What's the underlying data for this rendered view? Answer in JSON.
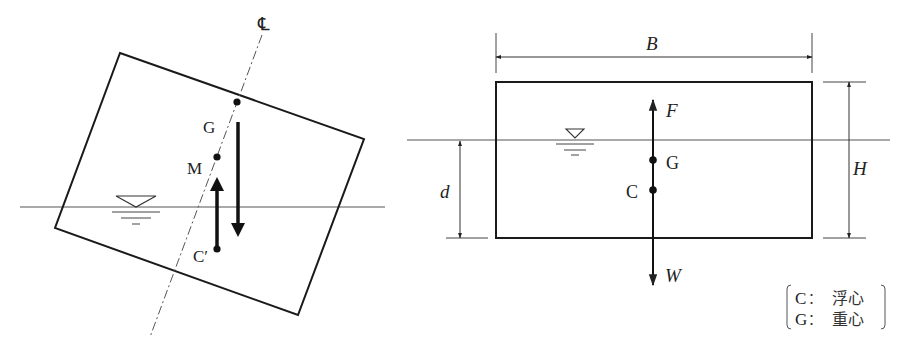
{
  "left_figure": {
    "centerline_label": "℄",
    "labels": {
      "G": "G",
      "M": "M",
      "C_prime": "C′"
    },
    "water_symbol": "▽"
  },
  "right_figure": {
    "dimensions": {
      "width": "B",
      "height": "H",
      "draft": "d"
    },
    "forces": {
      "buoyancy": "F",
      "weight": "W"
    },
    "points": {
      "G": "G",
      "C": "C"
    },
    "water_symbol": "▽",
    "legend": [
      {
        "symbol": "C",
        "sep": "：",
        "meaning": "浮心"
      },
      {
        "symbol": "G",
        "sep": "：",
        "meaning": "重心"
      }
    ]
  },
  "colors": {
    "line": "#1a1a1a",
    "thin_line": "#555555",
    "background": "#ffffff"
  }
}
